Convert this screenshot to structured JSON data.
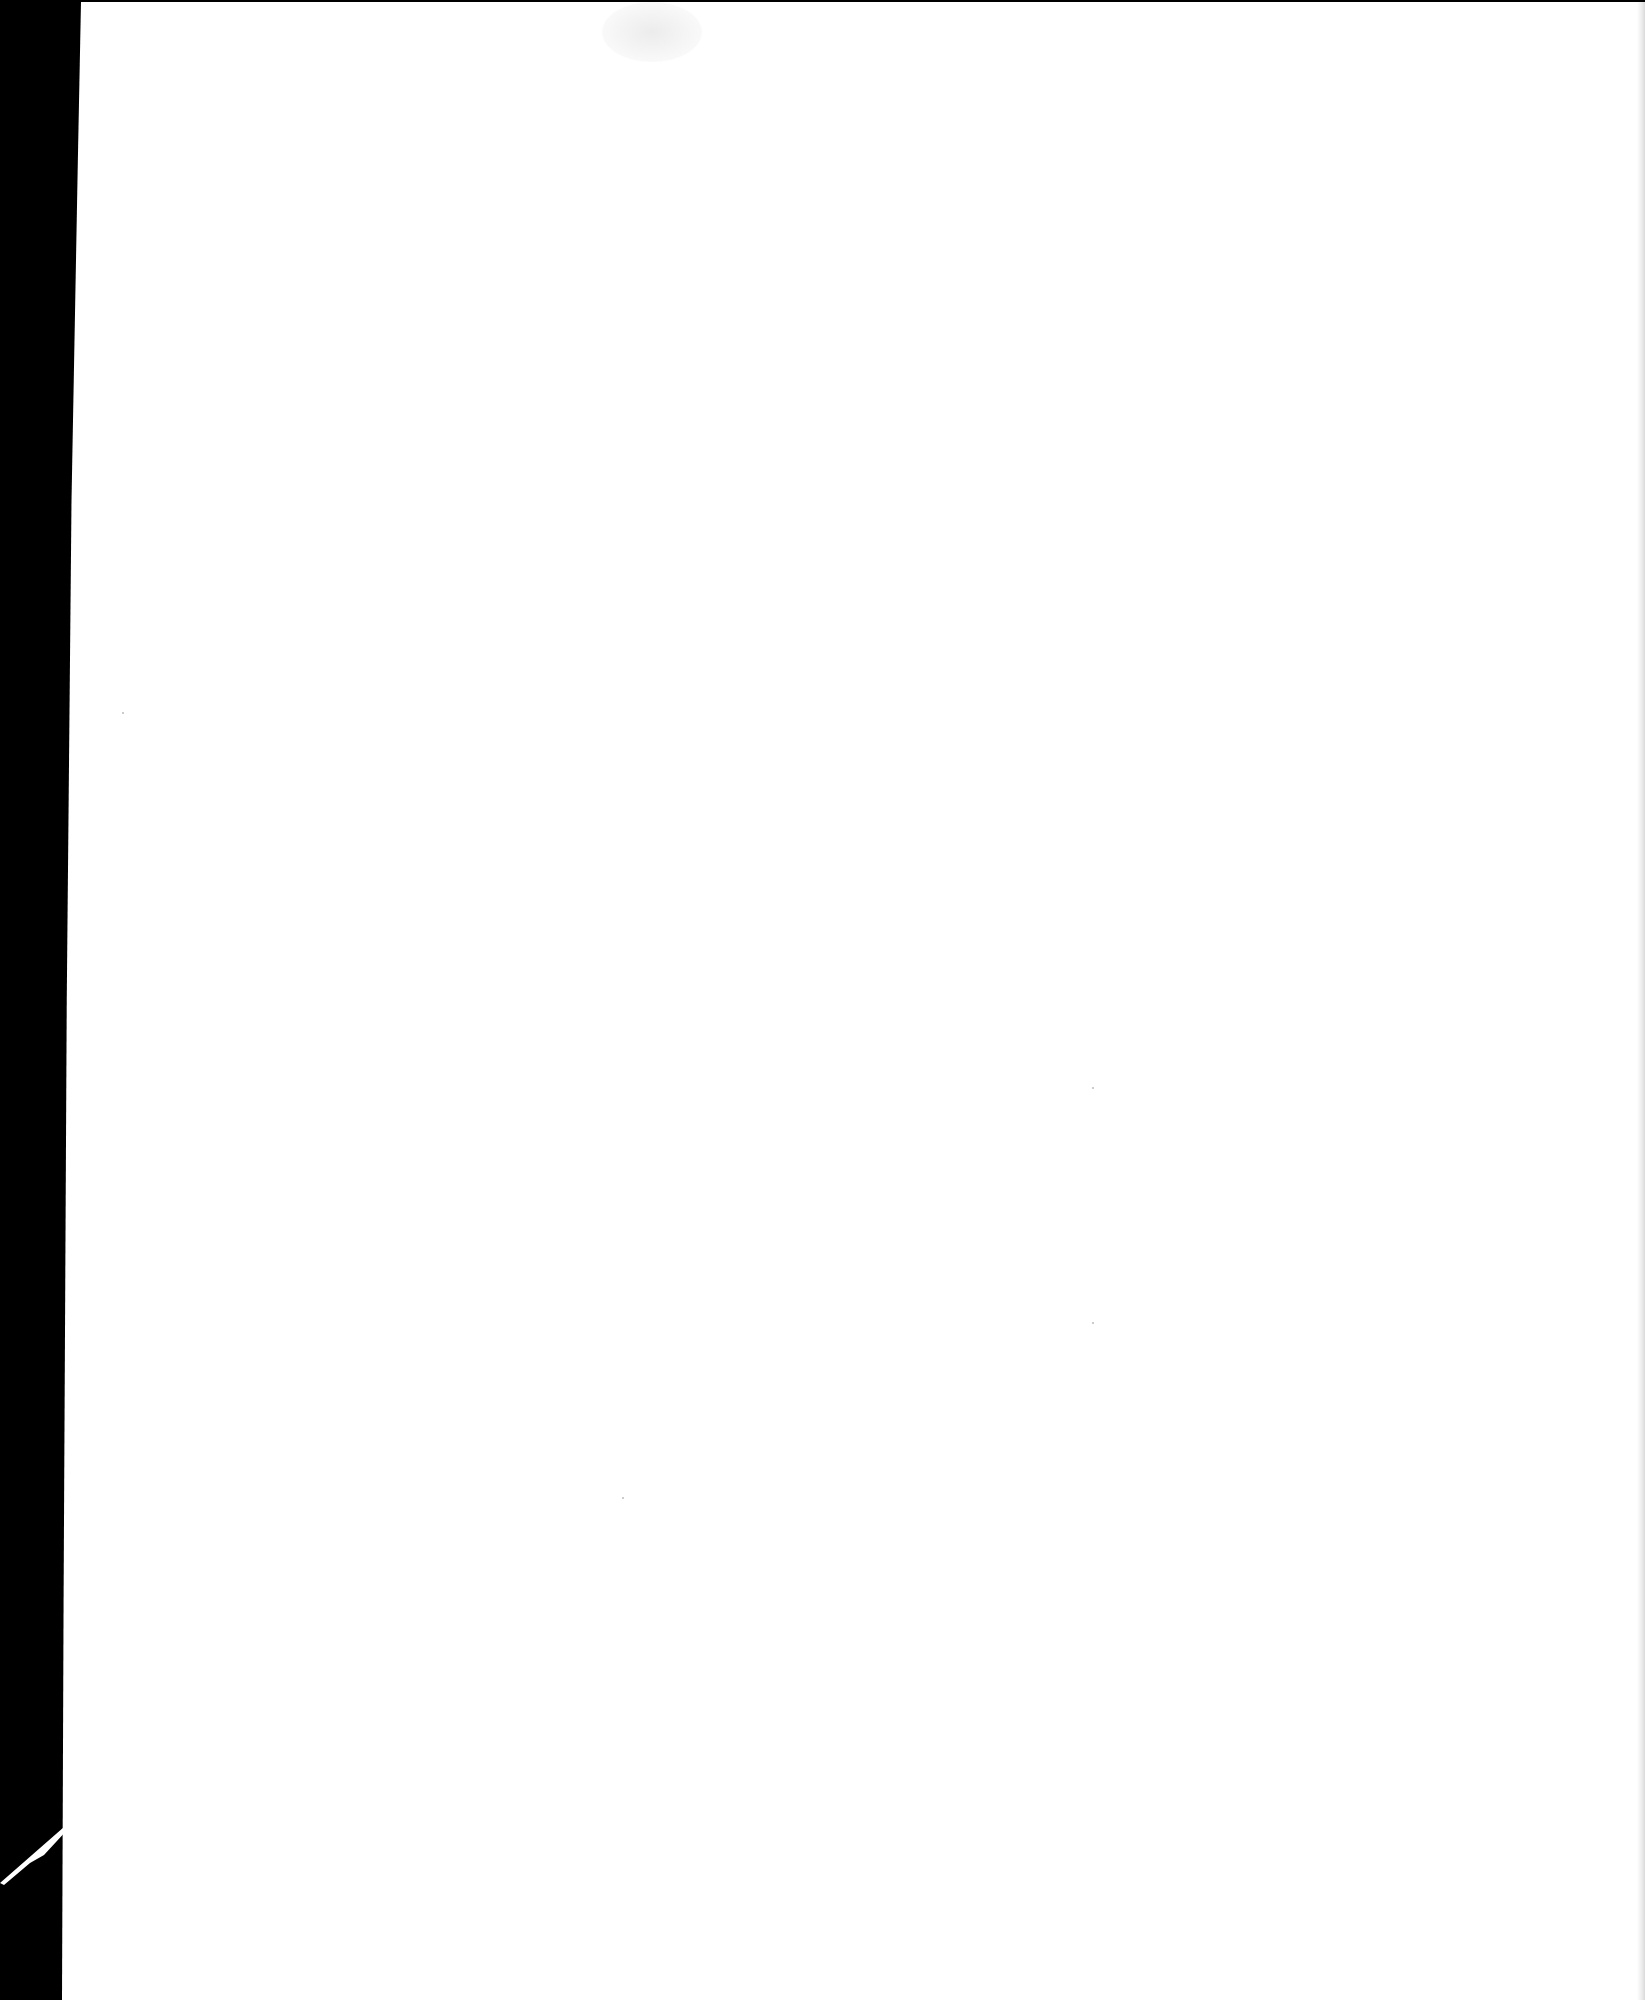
{
  "document": {
    "type": "scanned-page",
    "content": "",
    "page_color": "#ffffff",
    "scan_background_color": "#000000"
  }
}
